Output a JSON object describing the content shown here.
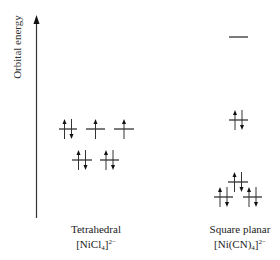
{
  "axis": {
    "label": "Orbital energy",
    "x": 36.5,
    "y_top": 15,
    "y_bottom": 218
  },
  "colors": {
    "line": "#333333",
    "text": "#222222"
  },
  "complexes": [
    {
      "id": "tetrahedral",
      "geometry_label": "Tetrahedral",
      "formula_base": "[NiCl",
      "formula_sub": "4",
      "formula_close": "]",
      "formula_sup": "2−",
      "caption_center_x": 96,
      "orbitals": [
        {
          "x1": 59,
          "x2": 77,
          "y": 129,
          "electrons": [
            "up",
            "down"
          ],
          "set": "t2"
        },
        {
          "x1": 86,
          "x2": 105,
          "y": 129,
          "electrons": [
            "up"
          ],
          "set": "t2"
        },
        {
          "x1": 114,
          "x2": 134,
          "y": 129,
          "electrons": [
            "up"
          ],
          "set": "t2"
        },
        {
          "x1": 72,
          "x2": 92,
          "y": 160,
          "electrons": [
            "up",
            "down"
          ],
          "set": "e"
        },
        {
          "x1": 100,
          "x2": 119,
          "y": 160,
          "electrons": [
            "up",
            "down"
          ],
          "set": "e"
        }
      ]
    },
    {
      "id": "square-planar",
      "geometry_label": "Square planar",
      "formula_base": "[Ni(CN)",
      "formula_sub": "4",
      "formula_close": "]",
      "formula_sup": "2−",
      "caption_center_x": 240,
      "orbitals": [
        {
          "x1": 229,
          "x2": 248,
          "y": 37,
          "electrons": [],
          "set": "dx2-y2"
        },
        {
          "x1": 229,
          "x2": 248,
          "y": 120,
          "electrons": [
            "up",
            "down"
          ],
          "set": "dxy"
        },
        {
          "x1": 228,
          "x2": 248,
          "y": 182,
          "electrons": [
            "up",
            "down"
          ],
          "set": "dz2"
        },
        {
          "x1": 214,
          "x2": 233,
          "y": 197,
          "electrons": [
            "up",
            "down"
          ],
          "set": "dxz/dyz"
        },
        {
          "x1": 243,
          "x2": 262,
          "y": 197,
          "electrons": [
            "up",
            "down"
          ],
          "set": "dxz/dyz"
        }
      ]
    }
  ]
}
